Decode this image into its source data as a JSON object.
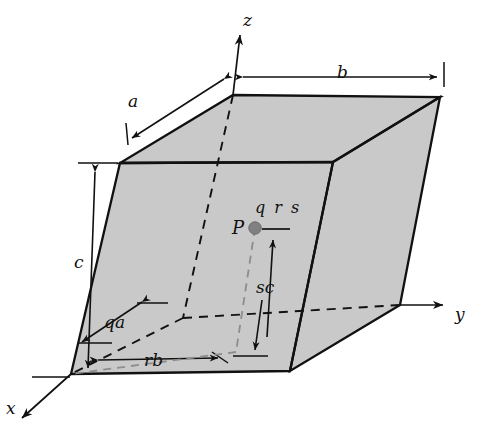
{
  "figure": {
    "type": "diagram",
    "background_color": "#ffffff",
    "face_fill_color": "#c9c9c9",
    "edge_color": "#111111",
    "hidden_edge_color": "#111111",
    "point_color": "#808080"
  },
  "axes": {
    "z": {
      "label": "z",
      "x": 243,
      "y": 12,
      "direction": "up"
    },
    "y": {
      "label": "y",
      "x": 455,
      "y": 306,
      "direction": "right"
    },
    "x": {
      "label": "x",
      "x": 6,
      "y": 400,
      "direction": "down-left"
    }
  },
  "dimensions": [
    {
      "name": "a",
      "label": "a",
      "x": 128,
      "y": 93,
      "description": "edge length along x, upper-left double arrow"
    },
    {
      "name": "b",
      "label": "b",
      "x": 337,
      "y": 64,
      "description": "edge length along y, top horizontal double arrow"
    },
    {
      "name": "c",
      "label": "c",
      "x": 74,
      "y": 254,
      "description": "edge length along z, left vertical double arrow"
    }
  ],
  "annotations": [
    {
      "name": "qa",
      "label": "qa",
      "x": 104,
      "y": 314,
      "description": "fractional distance q along a"
    },
    {
      "name": "rb",
      "label": "rb",
      "x": 144,
      "y": 352,
      "description": "fractional distance r along b"
    },
    {
      "name": "sc",
      "label": "sc",
      "x": 256,
      "y": 279,
      "description": "fractional distance s along c"
    },
    {
      "name": "point-label",
      "label": "P",
      "x": 232,
      "y": 222,
      "description": "interior point"
    },
    {
      "name": "coordinates-label",
      "label": "q r s",
      "x": 255,
      "y": 204,
      "description": "fractional coordinates of P"
    }
  ],
  "geometry": {
    "vertices": {
      "top_back_left": [
        233,
        95
      ],
      "top_back_right": [
        440,
        97
      ],
      "top_front_left": [
        120,
        163
      ],
      "top_front_right": [
        333,
        162
      ],
      "bottom_front_left": [
        71,
        374
      ],
      "bottom_front_right": [
        290,
        371
      ],
      "bottom_back_right": [
        400,
        305
      ],
      "bottom_back_left": [
        183,
        318
      ]
    },
    "point_P": [
      255,
      228
    ]
  }
}
